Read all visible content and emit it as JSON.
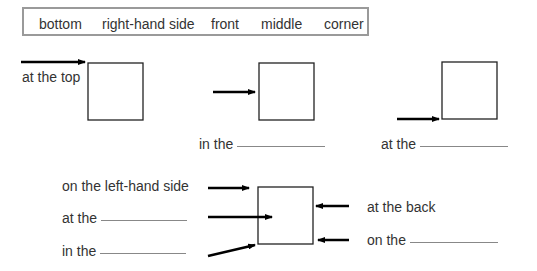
{
  "word_box": {
    "words": [
      "bottom",
      "right-hand side",
      "front",
      "middle",
      "corner"
    ]
  },
  "diagrams": {
    "top_row": [
      {
        "label": "at the top",
        "answer": ""
      },
      {
        "label": "in the",
        "answer": ""
      },
      {
        "label": "at the",
        "answer": ""
      }
    ],
    "bottom_left": [
      {
        "label": "on the left-hand side",
        "answer": ""
      },
      {
        "label": "at the",
        "answer": ""
      },
      {
        "label": "in the",
        "answer": ""
      }
    ],
    "bottom_right": [
      {
        "label": "at the back",
        "answer": ""
      },
      {
        "label": "on the",
        "answer": ""
      }
    ]
  },
  "colors": {
    "text": "#333333",
    "box_border": "#9a9a9a",
    "line": "#000000"
  }
}
